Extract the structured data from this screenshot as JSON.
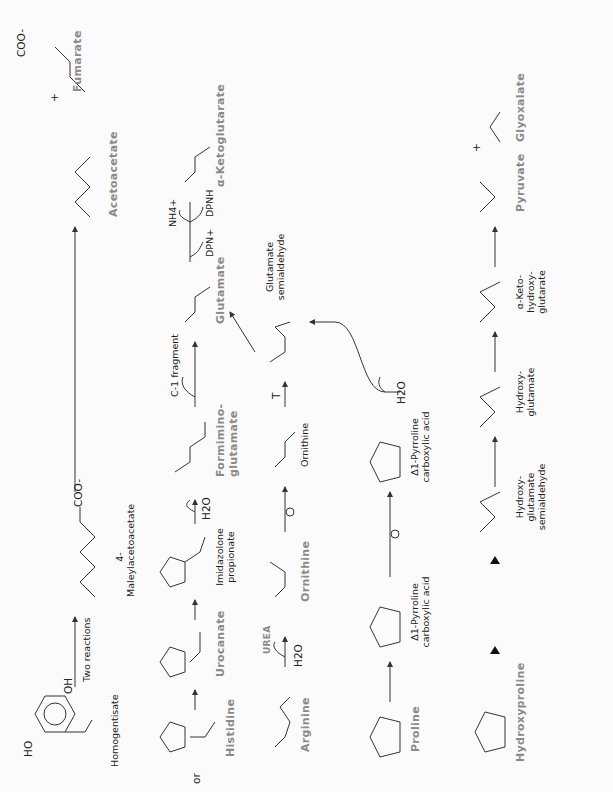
{
  "figure": {
    "orientation": "rotated 90 degrees counterclockwise",
    "label_color": "#8a8a8a",
    "line_color": "#333333"
  },
  "rows": {
    "tyrosine_branch": {
      "compounds": [
        {
          "name": "Homogentisate",
          "groups": [
            "HO",
            "OH",
            "O",
            "O-"
          ]
        },
        {
          "name": "4-Maleylacetoacetate",
          "groups": [
            "COO-",
            "O",
            "O",
            "O-",
            "O"
          ]
        },
        {
          "name": "Acetoacetate",
          "groups": [
            "O",
            "O-",
            "O"
          ]
        },
        {
          "name": "Fumarate",
          "groups": [
            "COO-",
            "O",
            "O-"
          ]
        }
      ],
      "arrow_label": "Two reactions",
      "plus": "+"
    },
    "histidine_branch": {
      "prefix": "or",
      "compounds": [
        {
          "name": "Histidine",
          "groups": [
            "HN",
            "N",
            "H3+N",
            "COO-"
          ]
        },
        {
          "name": "Urocanate",
          "groups": [
            "HN",
            "N",
            "COO-"
          ]
        },
        {
          "name": "Imidazolone propionate",
          "groups": [
            "HN",
            "N",
            "O",
            "COO-"
          ]
        },
        {
          "name": "Formimino-glutamate",
          "groups": [
            "NH",
            "CH",
            "HN",
            "O-",
            "O",
            "COO-"
          ]
        },
        {
          "name": "Glutamate",
          "groups": [
            "NH3+",
            "COO-",
            "COO-"
          ]
        },
        {
          "name": "α-Ketoglutarate",
          "groups": [
            "O",
            "COO-",
            "COO-"
          ]
        }
      ],
      "reagents": {
        "h2o": "H2O",
        "c1": "C-1 fragment",
        "dpn_plus": "DPN+",
        "nh4": "NH4+",
        "dpnh": "DPNH"
      }
    },
    "arginine_branch": {
      "compounds": [
        {
          "name": "Arginine",
          "groups": [
            "NH2+",
            "H2N",
            "NH",
            "H3+N",
            "COO-"
          ]
        },
        {
          "name": "Ornithine",
          "groups": [
            "NH3+",
            "H3+N",
            "COO-"
          ]
        },
        {
          "name": "Ornithine",
          "groups": [
            "H3+N",
            "COO-",
            "NH3+"
          ],
          "style": "plain"
        },
        {
          "name": "Glutamate semialdehyde",
          "groups": [
            "H3+N",
            "COO-",
            "O",
            "H"
          ]
        }
      ],
      "reagents": {
        "h2o": "H2O",
        "urea": "UREA",
        "t": "T"
      }
    },
    "proline_branch": {
      "compounds": [
        {
          "name": "Proline",
          "groups": [
            "N",
            "H",
            "COO-"
          ]
        },
        {
          "name": "Δ1-Pyrroline carboxylic acid",
          "groups": [
            "N",
            "COO-"
          ]
        },
        {
          "name": "Δ1-Pyrroline carboxylic acid",
          "groups": [
            "N",
            "COO-"
          ],
          "style": "plain"
        }
      ],
      "reagents": {
        "h2o": "H2O"
      }
    },
    "hydroxyproline_branch": {
      "compounds": [
        {
          "name": "Hydroxyproline",
          "groups": [
            "HO",
            "N",
            "H",
            "COO-"
          ]
        },
        {
          "name": "Hydroxy-glutamate semialdehyde",
          "groups": [
            "H3+N",
            "COO-",
            "O",
            "HO"
          ]
        },
        {
          "name": "Hydroxy-glutamate",
          "groups": [
            "H3+N",
            "COO-",
            "O",
            "O-",
            "HO"
          ]
        },
        {
          "name": "α-Keto-hydroxy-glutarate",
          "groups": [
            "O",
            "COO-",
            "COO-",
            "HO"
          ]
        },
        {
          "name": "Pyruvate",
          "groups": [
            "O",
            "COO-"
          ]
        },
        {
          "name": "Glyoxalate",
          "groups": [
            "O",
            "COO-"
          ]
        }
      ],
      "plus": "+",
      "markers": [
        "▲",
        "▲",
        "▲"
      ]
    }
  }
}
